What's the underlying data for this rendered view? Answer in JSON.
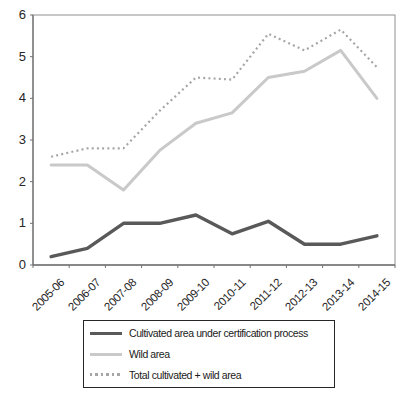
{
  "chart_data": {
    "type": "line",
    "title": "",
    "xlabel": "",
    "ylabel": "",
    "categories": [
      "2005-06",
      "2006-07",
      "2007-08",
      "2008-09",
      "2009-10",
      "2010-11",
      "2011-12",
      "2012-13",
      "2013-14",
      "2014-15"
    ],
    "series": [
      {
        "name": "Cultivated area under certification process",
        "values": [
          0.2,
          0.4,
          1.0,
          1.0,
          1.2,
          0.75,
          1.05,
          0.5,
          0.5,
          0.7
        ],
        "color": "#595959",
        "style": "solid",
        "width": 3.4
      },
      {
        "name": "Wild area",
        "values": [
          2.4,
          2.4,
          1.8,
          2.75,
          3.4,
          3.65,
          4.5,
          4.65,
          5.15,
          4.0
        ],
        "color": "#c9c9c9",
        "style": "solid",
        "width": 3
      },
      {
        "name": "Total cultivated + wild area",
        "values": [
          2.6,
          2.8,
          2.8,
          3.7,
          4.5,
          4.45,
          5.55,
          5.15,
          5.65,
          4.75
        ],
        "color": "#a6a6a6",
        "style": "dotted",
        "width": 2.2
      }
    ],
    "ylim": [
      0,
      6
    ],
    "yticks": [
      "0",
      "1",
      "2",
      "3",
      "4",
      "5",
      "6"
    ],
    "grid": false,
    "legend_position": "bottom-center"
  },
  "colors": {
    "plot_border": "#8f8f8f",
    "axis_line": "#737373",
    "tick_label": "#262626",
    "legend_border": "#262626",
    "background": "#ffffff"
  }
}
